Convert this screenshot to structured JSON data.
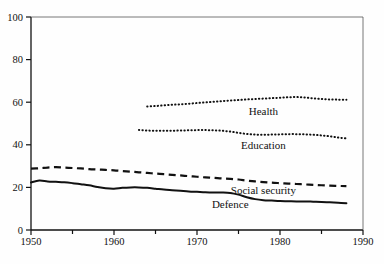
{
  "chart_data": {
    "type": "line",
    "title": "",
    "subtitle": "",
    "xlabel": "",
    "ylabel": "",
    "xlim": [
      1950,
      1990
    ],
    "ylim": [
      0,
      100
    ],
    "grid": false,
    "legend_position": "inline-annotations",
    "x_ticks": [
      {
        "value": 1950,
        "label": "1950",
        "major": true
      },
      {
        "value": 1955,
        "label": "",
        "major": false
      },
      {
        "value": 1960,
        "label": "1960",
        "major": true
      },
      {
        "value": 1965,
        "label": "",
        "major": false
      },
      {
        "value": 1970,
        "label": "1970",
        "major": true
      },
      {
        "value": 1975,
        "label": "",
        "major": false
      },
      {
        "value": 1980,
        "label": "1980",
        "major": true
      },
      {
        "value": 1985,
        "label": "",
        "major": false
      },
      {
        "value": 1990,
        "label": "1990",
        "major": true
      }
    ],
    "y_ticks": [
      {
        "value": 0,
        "label": "0"
      },
      {
        "value": 20,
        "label": "20"
      },
      {
        "value": 40,
        "label": "40"
      },
      {
        "value": 60,
        "label": "60"
      },
      {
        "value": 80,
        "label": "80"
      },
      {
        "value": 100,
        "label": "100"
      }
    ],
    "series": [
      {
        "name": "Health",
        "label": "Health",
        "style": "dotted",
        "color": "#111111",
        "label_x": 1978.0,
        "label_y": 54.0,
        "x": [
          1964,
          1965,
          1966,
          1967,
          1968,
          1969,
          1970,
          1971,
          1972,
          1973,
          1974,
          1975,
          1976,
          1977,
          1978,
          1979,
          1980,
          1981,
          1982,
          1983,
          1984,
          1985,
          1986,
          1987,
          1988
        ],
        "values": [
          58.0,
          58.2,
          58.5,
          58.8,
          59.0,
          59.3,
          59.6,
          59.9,
          60.2,
          60.5,
          60.8,
          61.0,
          61.3,
          61.5,
          61.7,
          61.9,
          62.1,
          62.3,
          62.4,
          62.2,
          61.8,
          61.5,
          61.3,
          61.2,
          61.2
        ]
      },
      {
        "name": "Education",
        "label": "Education",
        "style": "dotted",
        "color": "#111111",
        "label_x": 1978.0,
        "label_y": 38.0,
        "x": [
          1963,
          1964,
          1965,
          1966,
          1967,
          1968,
          1969,
          1970,
          1971,
          1972,
          1973,
          1974,
          1975,
          1976,
          1977,
          1978,
          1979,
          1980,
          1981,
          1982,
          1983,
          1984,
          1985,
          1986,
          1987,
          1988
        ],
        "values": [
          47.0,
          46.7,
          46.6,
          46.6,
          46.6,
          46.7,
          46.8,
          46.9,
          46.9,
          46.8,
          46.6,
          46.2,
          45.6,
          45.1,
          44.8,
          44.7,
          44.8,
          44.9,
          45.0,
          45.0,
          44.9,
          44.7,
          44.4,
          44.0,
          43.4,
          43.0
        ]
      },
      {
        "name": "Social security",
        "label": "Social security",
        "style": "dashed",
        "color": "#111111",
        "label_x": 1978.0,
        "label_y": 17.0,
        "x": [
          1950,
          1951,
          1952,
          1953,
          1954,
          1955,
          1956,
          1957,
          1958,
          1959,
          1960,
          1961,
          1962,
          1963,
          1964,
          1965,
          1966,
          1967,
          1968,
          1969,
          1970,
          1971,
          1972,
          1973,
          1974,
          1975,
          1976,
          1977,
          1978,
          1979,
          1980,
          1981,
          1982,
          1983,
          1984,
          1985,
          1986,
          1987,
          1988
        ],
        "values": [
          28.8,
          29.0,
          29.3,
          29.5,
          29.3,
          29.1,
          28.9,
          28.6,
          28.4,
          28.2,
          28.0,
          27.7,
          27.4,
          27.1,
          26.8,
          26.5,
          26.2,
          25.9,
          25.6,
          25.3,
          25.0,
          24.7,
          24.5,
          24.2,
          24.0,
          23.7,
          23.2,
          22.8,
          22.5,
          22.2,
          22.0,
          21.8,
          21.6,
          21.4,
          21.2,
          21.0,
          20.8,
          20.7,
          20.6
        ]
      },
      {
        "name": "Defence",
        "label": "Defence",
        "style": "solid",
        "color": "#111111",
        "label_x": 1974.0,
        "label_y": 10.5,
        "x": [
          1950,
          1951,
          1952,
          1953,
          1954,
          1955,
          1956,
          1957,
          1958,
          1959,
          1960,
          1961,
          1962,
          1963,
          1964,
          1965,
          1966,
          1967,
          1968,
          1969,
          1970,
          1971,
          1972,
          1973,
          1974,
          1975,
          1976,
          1977,
          1978,
          1979,
          1980,
          1981,
          1982,
          1983,
          1984,
          1985,
          1986,
          1987,
          1988
        ],
        "values": [
          22.3,
          23.2,
          22.8,
          22.6,
          22.4,
          22.0,
          21.5,
          21.0,
          20.2,
          19.6,
          19.4,
          19.8,
          20.0,
          20.0,
          19.8,
          19.4,
          19.0,
          18.7,
          18.4,
          18.1,
          17.9,
          17.7,
          17.6,
          17.6,
          17.4,
          16.6,
          15.4,
          14.5,
          14.0,
          13.8,
          13.6,
          13.5,
          13.4,
          13.4,
          13.3,
          13.2,
          13.0,
          12.8,
          12.6
        ]
      }
    ]
  }
}
